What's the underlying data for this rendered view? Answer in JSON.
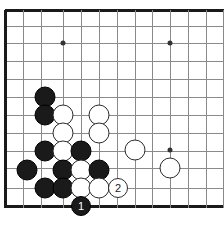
{
  "diagram": {
    "kind": "go-board-diagram",
    "colors": {
      "background": "#ffffff",
      "grid_line": "#8a8a8a",
      "border_line": "#1a1a1a",
      "star_point": "#333333",
      "black_stone": "#1a1a1a",
      "white_stone": "#ffffff",
      "white_stone_outline": "#2b2b2b",
      "black_label_text": "#ffffff",
      "white_label_text": "#1a1a1a"
    },
    "board": {
      "width": 224,
      "height": 228,
      "column_x": [
        5,
        23,
        41,
        63,
        81,
        99,
        117,
        135,
        152,
        170,
        188,
        206,
        223
      ],
      "row_y": [
        10,
        26,
        43,
        61,
        79,
        97,
        115,
        133,
        151,
        168,
        188,
        206
      ],
      "left_border_x": 5,
      "top_border_y": 10,
      "bottom_border_y": 206,
      "stone_diameter": 21,
      "marked_stone_diameter": 20
    },
    "star_points": [
      {
        "name": "star-point-upper-left",
        "x": 63,
        "y": 43
      },
      {
        "name": "star-point-upper-right",
        "x": 170,
        "y": 43
      },
      {
        "name": "star-point-lower-right",
        "x": 170,
        "y": 150
      }
    ],
    "stones": [
      {
        "name": "black-stone-a",
        "color": "black",
        "x": 45,
        "y": 97,
        "label": ""
      },
      {
        "name": "black-stone-b",
        "color": "black",
        "x": 45,
        "y": 115,
        "label": ""
      },
      {
        "name": "white-stone-a",
        "color": "white",
        "x": 63,
        "y": 115,
        "label": ""
      },
      {
        "name": "white-stone-b",
        "color": "white",
        "x": 99,
        "y": 115,
        "label": ""
      },
      {
        "name": "white-stone-c",
        "color": "white",
        "x": 63,
        "y": 133,
        "label": ""
      },
      {
        "name": "white-stone-d",
        "color": "white",
        "x": 99,
        "y": 133,
        "label": ""
      },
      {
        "name": "black-stone-c",
        "color": "black",
        "x": 45,
        "y": 151,
        "label": ""
      },
      {
        "name": "white-stone-e",
        "color": "white",
        "x": 63,
        "y": 151,
        "label": ""
      },
      {
        "name": "black-stone-d",
        "color": "black",
        "x": 81,
        "y": 151,
        "label": ""
      },
      {
        "name": "white-stone-right-upper",
        "color": "white",
        "x": 135,
        "y": 150,
        "label": ""
      },
      {
        "name": "black-stone-e",
        "color": "black",
        "x": 27,
        "y": 170,
        "label": ""
      },
      {
        "name": "black-stone-f",
        "color": "black",
        "x": 63,
        "y": 170,
        "label": ""
      },
      {
        "name": "white-stone-f",
        "color": "white",
        "x": 81,
        "y": 170,
        "label": ""
      },
      {
        "name": "black-stone-g",
        "color": "black",
        "x": 99,
        "y": 170,
        "label": ""
      },
      {
        "name": "white-stone-right-lower",
        "color": "white",
        "x": 170,
        "y": 168,
        "label": ""
      },
      {
        "name": "black-stone-h",
        "color": "black",
        "x": 45,
        "y": 188,
        "label": ""
      },
      {
        "name": "black-stone-i",
        "color": "black",
        "x": 63,
        "y": 188,
        "label": ""
      },
      {
        "name": "white-stone-g",
        "color": "white",
        "x": 81,
        "y": 188,
        "label": ""
      },
      {
        "name": "white-stone-h",
        "color": "white",
        "x": 99,
        "y": 188,
        "label": ""
      },
      {
        "name": "white-move-2",
        "color": "white",
        "x": 118,
        "y": 188,
        "label": "2"
      },
      {
        "name": "black-move-1",
        "color": "black",
        "x": 81,
        "y": 206,
        "label": "1"
      }
    ],
    "moves": [
      {
        "number": "1",
        "color": "black"
      },
      {
        "number": "2",
        "color": "white"
      }
    ]
  }
}
